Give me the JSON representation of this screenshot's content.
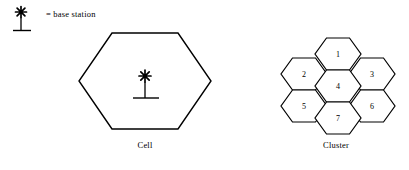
{
  "figure": {
    "background_color": "#ffffff",
    "line_color": "#000000",
    "text_color": "#000000"
  },
  "legend": {
    "symbol_icon": "base-station-antenna-icon",
    "equals_sign": "=",
    "text": "= base station"
  },
  "cell": {
    "caption": "Cell",
    "shape": "hexagon",
    "orientation": "flat-top",
    "station_icon": "base-station-antenna-icon",
    "station_position": "center"
  },
  "cluster": {
    "caption": "Cluster",
    "shape": "hexagon",
    "orientation": "flat-top",
    "cell_count": 7,
    "cells": [
      {
        "number": "1",
        "position": "top-center"
      },
      {
        "number": "2",
        "position": "upper-left"
      },
      {
        "number": "3",
        "position": "upper-right"
      },
      {
        "number": "4",
        "position": "center"
      },
      {
        "number": "5",
        "position": "lower-left"
      },
      {
        "number": "6",
        "position": "lower-right"
      },
      {
        "number": "7",
        "position": "bottom-center"
      }
    ]
  }
}
